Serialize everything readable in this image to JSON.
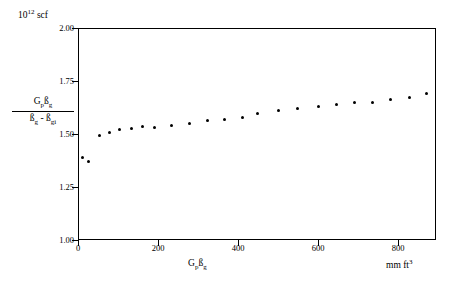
{
  "chart_data": {
    "type": "scatter",
    "title": "",
    "units_note": "10¹² scf",
    "units_mantissa": "10",
    "units_exponent": "12",
    "units_suffix": " scf",
    "ylabel_numerator": "Gpßg",
    "ylabel_denominator": "ßg - ßgi",
    "xlabel": "Gpßg",
    "xunits": "mm ft³",
    "xlim": [
      0,
      800
    ],
    "ylim": [
      1.0,
      2.0
    ],
    "xticks": [
      "0",
      "200",
      "400",
      "600",
      "800"
    ],
    "xtick_values": [
      0,
      200,
      400,
      600,
      800
    ],
    "yticks": [
      "1.00",
      "1.25",
      "1.50",
      "1.75",
      "2.00"
    ],
    "ytick_values": [
      1.0,
      1.25,
      1.5,
      1.75,
      2.0
    ],
    "grid": false,
    "legend": "none",
    "series": [
      {
        "name": "Gpßg/(ßg - ßgi)",
        "marker": "filled-circle",
        "color": "#000000",
        "points": [
          [
            8,
            1.39
          ],
          [
            22,
            1.368
          ],
          [
            45,
            1.495
          ],
          [
            68,
            1.508
          ],
          [
            92,
            1.52
          ],
          [
            118,
            1.525
          ],
          [
            142,
            1.538
          ],
          [
            170,
            1.53
          ],
          [
            208,
            1.54
          ],
          [
            248,
            1.552
          ],
          [
            288,
            1.562
          ],
          [
            328,
            1.568
          ],
          [
            368,
            1.578
          ],
          [
            402,
            1.6
          ],
          [
            448,
            1.61
          ],
          [
            492,
            1.622
          ],
          [
            538,
            1.632
          ],
          [
            578,
            1.641
          ],
          [
            618,
            1.65
          ],
          [
            660,
            1.652
          ],
          [
            700,
            1.662
          ],
          [
            742,
            1.672
          ],
          [
            782,
            1.695
          ]
        ]
      }
    ]
  }
}
